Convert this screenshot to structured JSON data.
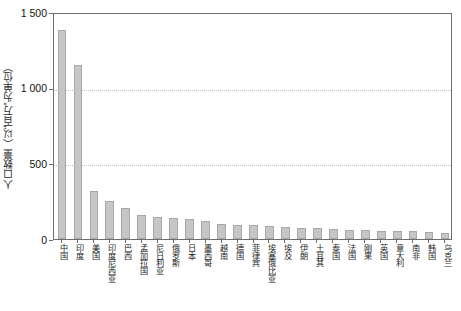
{
  "chart_data": {
    "type": "bar",
    "title": "",
    "xlabel": "",
    "ylabel": "人口数量（以“百万”为单位）",
    "ylim": [
      0,
      1500
    ],
    "yticks": [
      0,
      500,
      1000,
      1500
    ],
    "ytick_labels": [
      "0",
      "500",
      "1 000",
      "1 500"
    ],
    "grid": "horizontal-dotted",
    "legend": "none",
    "bar_color": "#c6c6c6",
    "bar_edge_color": "#a8a8a8",
    "axis_color": "#6e6e6e",
    "gridline_color": "#c9b9b9",
    "categories": [
      "中国",
      "印度",
      "美国",
      "印度尼西亚",
      "巴西",
      "孟加拉国",
      "尼日利亚",
      "俄罗斯",
      "日本",
      "墨西哥",
      "越南",
      "德国",
      "菲律宾",
      "埃塞俄比亚",
      "埃及",
      "伊朗",
      "土耳其",
      "泰国",
      "法国",
      "刚果",
      "英国",
      "意大利",
      "南非",
      "韩国",
      "乌克兰"
    ],
    "values": [
      1380,
      1150,
      320,
      250,
      205,
      160,
      145,
      140,
      130,
      120,
      100,
      95,
      90,
      85,
      80,
      75,
      72,
      68,
      62,
      58,
      55,
      52,
      50,
      46,
      42
    ]
  }
}
